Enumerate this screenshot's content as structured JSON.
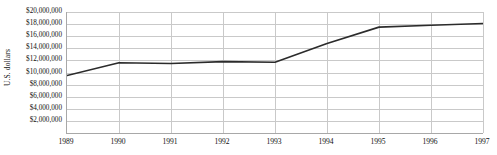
{
  "chart_data": {
    "type": "line",
    "title": "",
    "xlabel": "",
    "ylabel": "U.S. dollars",
    "categories": [
      "1989",
      "1990",
      "1991",
      "1992",
      "1993",
      "1994",
      "1995",
      "1996",
      "1997"
    ],
    "x": [
      1989,
      1990,
      1991,
      1992,
      1993,
      1994,
      1995,
      1996,
      1997
    ],
    "values": [
      9500000,
      11600000,
      11500000,
      11800000,
      11700000,
      14800000,
      17500000,
      17800000,
      18100000
    ],
    "series": [
      {
        "name": "U.S. dollars",
        "values": [
          9500000,
          11600000,
          11500000,
          11800000,
          11700000,
          14800000,
          17500000,
          17800000,
          18100000
        ],
        "color": "#2b2b2b"
      }
    ],
    "ylim": [
      0,
      20000000
    ],
    "xlim": [
      1989,
      1997
    ],
    "ytick_values": [
      2000000,
      4000000,
      6000000,
      8000000,
      10000000,
      12000000,
      14000000,
      16000000,
      18000000,
      20000000
    ],
    "ytick_labels": [
      "$2,000,000",
      "$4,000,000",
      "$6,000,000",
      "$8,000,000",
      "$10,000,000",
      "$12,000,000",
      "$14,000,000",
      "$16,000,000",
      "$18,000,000",
      "$20,000,000"
    ],
    "xtick_labels": [
      "1989",
      "1990",
      "1991",
      "1992",
      "1993",
      "1994",
      "1995",
      "1996",
      "1997"
    ],
    "grid": "horizontal-and-vertical",
    "legend": "none",
    "colors": {
      "line": "#2b2b2b",
      "grid": "#c9c9c9",
      "axis": "#a8a8a8",
      "text": "#111111",
      "background": "#ffffff"
    }
  }
}
